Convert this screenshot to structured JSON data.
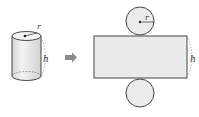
{
  "diagram": {
    "cylinder": {
      "radius_label": "r",
      "height_label": "h"
    },
    "arrow": {
      "direction": "right",
      "color": "#8a8a8a"
    },
    "net": {
      "top_circle_radius_label": "r",
      "rectangle_height_label": "h"
    },
    "colors": {
      "stroke": "#333333",
      "fill": "#e8e8e8",
      "fill_light": "#f2f2f2"
    }
  }
}
